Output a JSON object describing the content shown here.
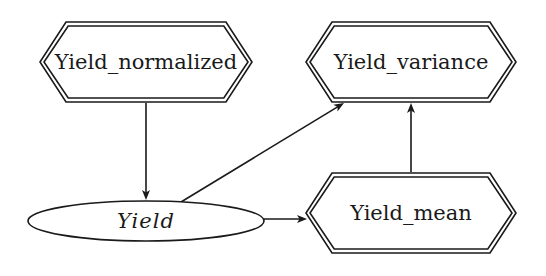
{
  "diagram": {
    "type": "directed-graph",
    "nodes": [
      {
        "id": "yield_normalized",
        "label": "Yield_normalized",
        "shape": "double-hexagon",
        "italic": false
      },
      {
        "id": "yield_variance",
        "label": "Yield_variance",
        "shape": "double-hexagon",
        "italic": false
      },
      {
        "id": "yield",
        "label": "Yield",
        "shape": "ellipse",
        "italic": true
      },
      {
        "id": "yield_mean",
        "label": "Yield_mean",
        "shape": "double-hexagon",
        "italic": false
      }
    ],
    "edges": [
      {
        "from": "yield_normalized",
        "to": "yield"
      },
      {
        "from": "yield",
        "to": "yield_variance"
      },
      {
        "from": "yield",
        "to": "yield_mean"
      },
      {
        "from": "yield_mean",
        "to": "yield_variance"
      }
    ],
    "colors": {
      "stroke": "#1a1a1a",
      "background": "#ffffff"
    }
  }
}
